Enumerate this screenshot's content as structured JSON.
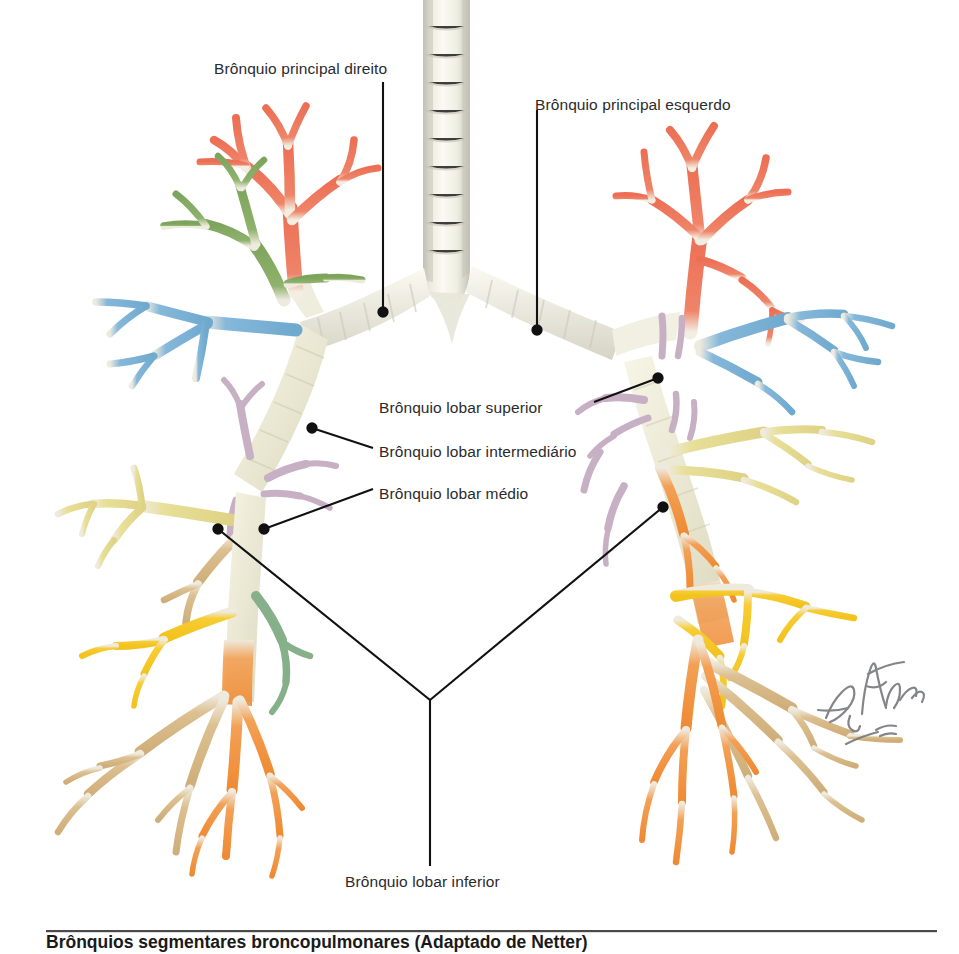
{
  "figure": {
    "title_alt": "Árvore traqueobrônquica — brônquios lobares",
    "language": "pt-BR",
    "background": "#ffffff",
    "label_color": "#2b2b2b",
    "leader_color": "#111111"
  },
  "labels": [
    {
      "id": "principal-direito",
      "text": "Brônquio principal direito",
      "x": 214,
      "y": 60,
      "align": "left"
    },
    {
      "id": "principal-esquerdo",
      "text": "Brônquio principal esquerdo",
      "x": 535,
      "y": 96,
      "align": "left"
    },
    {
      "id": "lobar-superior",
      "text": "Brônquio lobar superior",
      "x": 379,
      "y": 399,
      "align": "left"
    },
    {
      "id": "lobar-intermediario",
      "text": "Brônquio lobar intermediário",
      "x": 379,
      "y": 443,
      "align": "left"
    },
    {
      "id": "lobar-medio",
      "text": "Brônquio lobar médio",
      "x": 379,
      "y": 485,
      "align": "left"
    },
    {
      "id": "lobar-inferior",
      "text": "Brônquio lobar inferior",
      "x": 345,
      "y": 873,
      "align": "left"
    }
  ],
  "signature": {
    "name": "F. Netter",
    "credential": "M.D."
  },
  "caption": {
    "text": "Brônquios segmentares broncopulmonares (Adaptado de Netter)",
    "visible": "partially cropped at bottom edge"
  },
  "airway_colors": {
    "trachea": "#f2f0e6",
    "trachea_shade": "#cfcec4",
    "cartilage_ring": "#d9d8cc",
    "apical_red": "#ef7d63",
    "posterior_green": "#8cb069",
    "anterior_blue": "#7fb4d8",
    "lateral_cream": "#e6dc94",
    "medial_salmon": "#efa271",
    "superior_green": "#84b089",
    "basal_yellow": "#f5c82a",
    "basal_orange": "#f2943a",
    "basal_tan": "#d9bd8b",
    "hilar_mauve": "#c7b0c4"
  },
  "anatomy": {
    "segments_right_upper": [
      "apical (vermelho)",
      "posterior (verde)",
      "anterior (azul)"
    ],
    "segments_right_middle": [
      "lateral (creme)",
      "medial (salmão)"
    ],
    "segments_right_lower": [
      "superior (verde)",
      "basal (amarelo/laranja/bege)"
    ],
    "segments_left_upper": [
      "apicoposterior (vermelho)",
      "anterior (azul)"
    ],
    "segments_left_lingula": [
      "superior/inferior (creme)"
    ],
    "segments_left_lower": [
      "superior (laranja)",
      "basal (amarelo/bege)"
    ]
  }
}
